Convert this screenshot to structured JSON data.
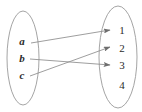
{
  "figure": {
    "type": "mapping-diagram",
    "background_color": "#ffffff",
    "stroke_color": "#8c8c8c",
    "label_color": "#2b2b2b",
    "width": 142,
    "height": 112
  },
  "domain_set": {
    "name": "left-oval",
    "shape": "ellipse",
    "center_x": 23,
    "center_y": 58,
    "radius_x": 16,
    "radius_y": 47,
    "elements": [
      {
        "label": "a",
        "x": 22,
        "y": 41
      },
      {
        "label": "b",
        "x": 22,
        "y": 58
      },
      {
        "label": "c",
        "x": 22,
        "y": 75
      }
    ]
  },
  "codomain_set": {
    "name": "right-oval",
    "shape": "ellipse",
    "center_x": 118,
    "center_y": 57,
    "radius_x": 19,
    "radius_y": 51,
    "elements": [
      {
        "label": "1",
        "x": 122,
        "y": 30
      },
      {
        "label": "2",
        "x": 122,
        "y": 48
      },
      {
        "label": "3",
        "x": 122,
        "y": 65
      },
      {
        "label": "4",
        "x": 122,
        "y": 85
      }
    ]
  },
  "arrows": [
    {
      "from": "a",
      "to": "1",
      "x1": 31,
      "y1": 43,
      "x2": 110,
      "y2": 30
    },
    {
      "from": "b",
      "to": "3",
      "x1": 30,
      "y1": 59,
      "x2": 110,
      "y2": 65
    },
    {
      "from": "c",
      "to": "2",
      "x1": 30,
      "y1": 76,
      "x2": 110,
      "y2": 47
    }
  ]
}
